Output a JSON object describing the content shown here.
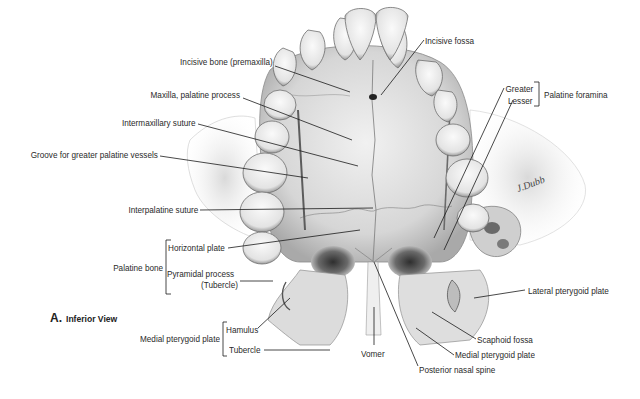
{
  "figure": {
    "panel_letter": "A.",
    "panel_title": "Inferior View",
    "artist_signature": "J.Dubb"
  },
  "labels": {
    "incisive_bone": "Incisive bone (premaxilla)",
    "maxilla_palatine_process": "Maxilla, palatine process",
    "intermaxillary_suture": "Intermaxillary suture",
    "groove_greater_palatine": "Groove for greater palatine vessels",
    "interpalatine_suture": "Interpalatine suture",
    "palatine_bone": "Palatine bone",
    "horizontal_plate": "Horizontal plate",
    "pyramidal_process": "Pyramidal process",
    "pyramidal_tubercle": "(Tubercle)",
    "medial_pterygoid_plate_group": "Medial pterygoid plate",
    "hamulus": "Hamulus",
    "tubercle": "Tubercle",
    "incisive_fossa": "Incisive fossa",
    "greater": "Greater",
    "lesser": "Lesser",
    "palatine_foramina": "Palatine foramina",
    "lateral_pterygoid_plate": "Lateral pterygoid plate",
    "scaphoid_fossa": "Scaphoid fossa",
    "medial_pterygoid_plate": "Medial pterygoid plate",
    "vomer": "Vomer",
    "posterior_nasal_spine": "Posterior nasal spine"
  },
  "colors": {
    "background": "#ffffff",
    "bone_light": "#e9e9e9",
    "bone_mid": "#c4c4c4",
    "bone_dark": "#6e6e6e",
    "leader_line": "#1a1a1a",
    "text": "#2a2a2a"
  }
}
